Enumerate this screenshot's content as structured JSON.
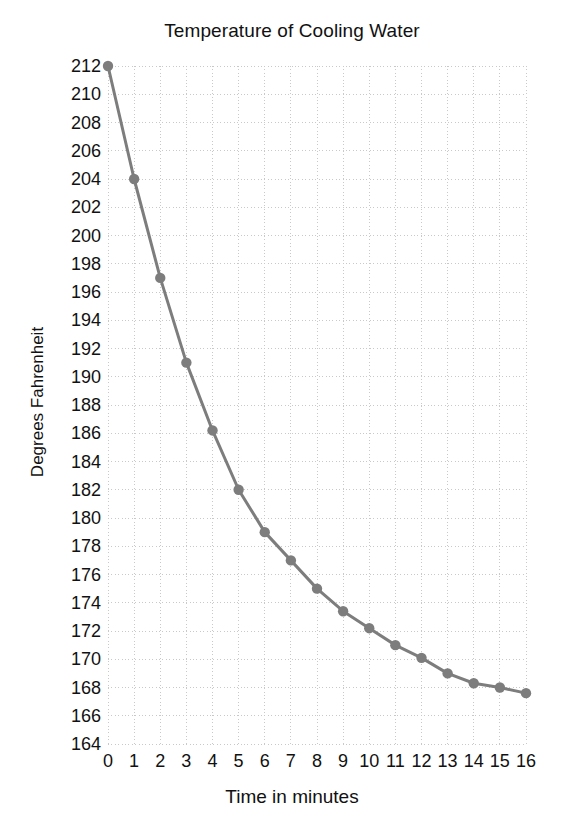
{
  "chart_data": {
    "type": "line",
    "title": "Temperature of Cooling Water",
    "xlabel": "Time in minutes",
    "ylabel": "Degrees Fahrenheit",
    "x": [
      0,
      1,
      2,
      3,
      4,
      5,
      6,
      7,
      8,
      9,
      10,
      11,
      12,
      13,
      14,
      15,
      16
    ],
    "values": [
      212,
      204,
      197,
      191,
      186.2,
      182,
      179,
      177,
      175,
      173.4,
      172.2,
      171,
      170.1,
      169,
      168.3,
      168,
      167.6
    ],
    "series": [
      {
        "name": "Water temperature",
        "values": [
          212,
          204,
          197,
          191,
          186.2,
          182,
          179,
          177,
          175,
          173.4,
          172.2,
          171,
          170.1,
          169,
          168.3,
          168,
          167.6
        ]
      }
    ],
    "xlim": [
      0,
      16
    ],
    "ylim": [
      164,
      212
    ],
    "xticks": [
      "0",
      "1",
      "2",
      "3",
      "4",
      "5",
      "6",
      "7",
      "8",
      "9",
      "10",
      "11",
      "12",
      "13",
      "14",
      "15",
      "16"
    ],
    "yticks": [
      "212",
      "210",
      "208",
      "206",
      "204",
      "202",
      "200",
      "198",
      "196",
      "194",
      "192",
      "190",
      "188",
      "186",
      "184",
      "182",
      "180",
      "178",
      "176",
      "174",
      "172",
      "170",
      "168",
      "166",
      "164"
    ],
    "grid": true,
    "grid_style": "dotted",
    "legend": false,
    "legend_position": "none",
    "marker": "circle",
    "line_color": "#7d7d7d",
    "marker_color": "#7d7d7d",
    "grid_color": "#c9c9c9",
    "background_color": "#ffffff"
  }
}
